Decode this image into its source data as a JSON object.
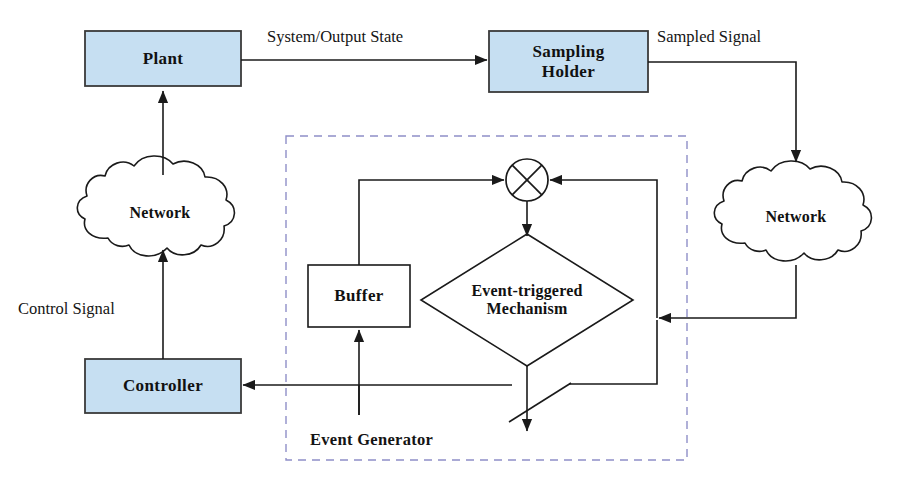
{
  "diagram": {
    "canvas": {
      "width": 904,
      "height": 490,
      "background": "#ffffff"
    },
    "colors": {
      "box_fill": "#c6dff2",
      "box_stroke": "#3a3a3a",
      "line": "#1a1a1a",
      "dashed_group": "#8f8fc8",
      "text": "#111111"
    },
    "blocks": [
      {
        "id": "plant",
        "label": "Plant",
        "shape": "rect",
        "x": 85,
        "y": 31,
        "w": 156,
        "h": 55
      },
      {
        "id": "sampling-holder",
        "label": "Sampling\nHolder",
        "line1": "Sampling",
        "line2": "Holder",
        "shape": "rect",
        "x": 489,
        "y": 31,
        "w": 159,
        "h": 61
      },
      {
        "id": "controller",
        "label": "Controller",
        "shape": "rect",
        "x": 85,
        "y": 359,
        "w": 156,
        "h": 54
      },
      {
        "id": "buffer",
        "label": "Buffer",
        "shape": "rect-plain",
        "x": 308,
        "y": 265,
        "w": 102,
        "h": 62
      }
    ],
    "clouds": [
      {
        "id": "network-left",
        "label": "Network",
        "cx": 160,
        "cy": 213
      },
      {
        "id": "network-right",
        "label": "Network",
        "cx": 796,
        "cy": 217
      }
    ],
    "diamond": {
      "id": "event-triggered-mechanism",
      "line1": "Event-triggered",
      "line2": "Mechanism",
      "cx": 527,
      "cy": 300,
      "hw": 106,
      "hh": 66
    },
    "junction": {
      "id": "summing-junction",
      "symbol": "crossed-circle",
      "cx": 527,
      "cy": 180,
      "r": 21
    },
    "switch": {
      "id": "trigger-switch",
      "symbol": "open-switch"
    },
    "group": {
      "id": "event-generator",
      "label": "Event Generator",
      "x": 286,
      "y": 136,
      "w": 401,
      "h": 324,
      "style": "dashed",
      "label_x": 310,
      "label_y": 430
    },
    "edge_labels": [
      {
        "id": "system-output-state",
        "text": "System/Output State",
        "x": 267,
        "y": 27
      },
      {
        "id": "sampled-signal",
        "text": "Sampled Signal",
        "x": 657,
        "y": 27
      },
      {
        "id": "control-signal",
        "text": "Control Signal",
        "x": 18,
        "y": 299
      }
    ],
    "edges": [
      {
        "id": "plant-to-sampling-holder",
        "from": "plant",
        "to": "sampling-holder",
        "label": "System/Output State"
      },
      {
        "id": "sampling-holder-to-network-right",
        "from": "sampling-holder",
        "to": "network-right",
        "label": "Sampled Signal"
      },
      {
        "id": "network-right-to-event-generator",
        "from": "network-right",
        "to": "event-triggered-mechanism",
        "label": ""
      },
      {
        "id": "mechanism-to-junction-right",
        "from": "event-triggered-mechanism",
        "to": "summing-junction",
        "label": ""
      },
      {
        "id": "buffer-to-junction-left",
        "from": "buffer",
        "to": "summing-junction",
        "label": ""
      },
      {
        "id": "junction-to-mechanism",
        "from": "summing-junction",
        "to": "event-triggered-mechanism",
        "label": ""
      },
      {
        "id": "switch-to-controller",
        "from": "trigger-switch",
        "to": "controller",
        "label": ""
      },
      {
        "id": "switch-to-buffer",
        "from": "trigger-switch",
        "to": "buffer",
        "label": ""
      },
      {
        "id": "controller-to-network-left",
        "from": "controller",
        "to": "network-left",
        "label": "Control Signal"
      },
      {
        "id": "network-left-to-plant",
        "from": "network-left",
        "to": "plant",
        "label": ""
      }
    ]
  }
}
